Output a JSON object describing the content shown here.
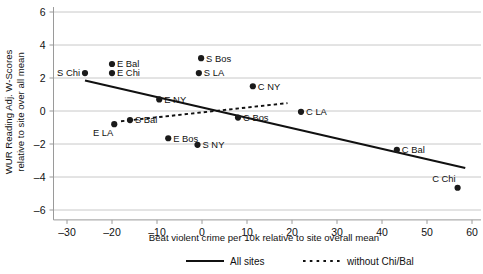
{
  "chart_data": {
    "type": "scatter",
    "title": "",
    "xlabel": "Beat violent crime per 10k relative to site overall mean",
    "ylabel_line1": "WUR Reading Adj. W-Scores",
    "ylabel_line2": "relative to site over all mean",
    "xlim": [
      -33,
      62
    ],
    "ylim": [
      -6.6,
      6.3
    ],
    "xticks": [
      -30,
      -20,
      -10,
      0,
      10,
      20,
      30,
      40,
      50,
      60
    ],
    "xticklabels": [
      "–30",
      "–20",
      "–10",
      "0",
      "10",
      "20",
      "30",
      "40",
      "50",
      "60"
    ],
    "yticks": [
      -6,
      -4,
      -2,
      0,
      2,
      4,
      6
    ],
    "yticklabels": [
      "–6",
      "–4",
      "–2",
      "0",
      "2",
      "4",
      "6"
    ],
    "grid": "horizontal",
    "legend_position": "bottom",
    "points": [
      {
        "label": "S Chi",
        "x": -26.0,
        "y": 2.3,
        "label_pos": "left"
      },
      {
        "label": "E Bal",
        "x": -20.0,
        "y": 2.85,
        "label_pos": "right"
      },
      {
        "label": "E Chi",
        "x": -20.0,
        "y": 2.3,
        "label_pos": "right"
      },
      {
        "label": "E LA",
        "x": -19.5,
        "y": -0.8,
        "label_pos": "below-left"
      },
      {
        "label": "S Bal",
        "x": -16.0,
        "y": -0.55,
        "label_pos": "right"
      },
      {
        "label": "E NY",
        "x": -9.5,
        "y": 0.7,
        "label_pos": "right"
      },
      {
        "label": "E Bos",
        "x": -7.5,
        "y": -1.65,
        "label_pos": "right"
      },
      {
        "label": "S Bos",
        "x": -0.2,
        "y": 3.2,
        "label_pos": "right"
      },
      {
        "label": "S LA",
        "x": -0.7,
        "y": 2.3,
        "label_pos": "right"
      },
      {
        "label": "S NY",
        "x": -1.0,
        "y": -2.05,
        "label_pos": "right"
      },
      {
        "label": "C Bos",
        "x": 8.0,
        "y": -0.4,
        "label_pos": "right"
      },
      {
        "label": "C NY",
        "x": 11.3,
        "y": 1.5,
        "label_pos": "right"
      },
      {
        "label": "C LA",
        "x": 22.0,
        "y": -0.05,
        "label_pos": "right"
      },
      {
        "label": "C Bal",
        "x": 43.3,
        "y": -2.35,
        "label_pos": "right"
      },
      {
        "label": "C Chi",
        "x": 56.8,
        "y": -4.65,
        "label_pos": "above-left"
      }
    ],
    "series": [
      {
        "name": "All sites",
        "style": "solid",
        "x_start": -26.0,
        "y_start": 1.85,
        "x_end": 58.5,
        "y_end": -3.45
      },
      {
        "name": "without Chi/Bal",
        "style": "dotted",
        "x_start": -18.0,
        "y_start": -0.62,
        "x_end": 19.0,
        "y_end": 0.48
      }
    ]
  },
  "legend": {
    "items": [
      {
        "label": "All sites",
        "style": "solid"
      },
      {
        "label": "without Chi/Bal",
        "style": "dotted"
      }
    ]
  }
}
